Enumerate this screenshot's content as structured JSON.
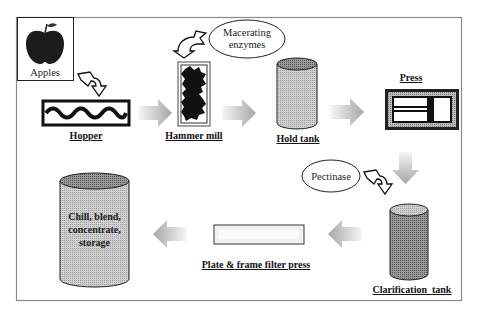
{
  "diagram": {
    "steps": [
      {
        "id": "apples",
        "label": "Apples"
      },
      {
        "id": "hopper",
        "label": "Hopper"
      },
      {
        "id": "hammer_mill",
        "label": "Hammer mill"
      },
      {
        "id": "hold_tank",
        "label": "Hold tank"
      },
      {
        "id": "press",
        "label": "Press"
      },
      {
        "id": "clarification_tank",
        "label": "Clarification  tank"
      },
      {
        "id": "filter_press",
        "label": "Plate & frame filter press"
      },
      {
        "id": "storage",
        "lines": [
          "Chill, blend,",
          "concentrate,",
          "storage"
        ]
      }
    ],
    "additives": [
      {
        "id": "macerating",
        "lines": [
          "Macerating",
          "enzymes"
        ],
        "target": "hammer_mill"
      },
      {
        "id": "pectinase",
        "label": "Pectinase",
        "target": "clarification_tank"
      }
    ],
    "flow": [
      "apples",
      "hopper",
      "hammer_mill",
      "hold_tank",
      "press",
      "clarification_tank",
      "filter_press",
      "storage"
    ],
    "colors": {
      "frame": "#8a8a8a",
      "tank_fill": "#c8c8c8",
      "clar_fill": "#8c8c8c",
      "arrow_light": "#f4f4f4",
      "arrow_dark": "#a8a8a8"
    }
  }
}
